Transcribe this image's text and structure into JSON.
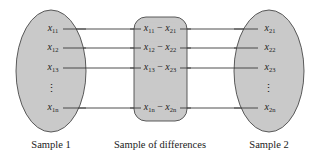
{
  "diagram": {
    "colors": {
      "fill": "#c9c9c9",
      "stroke": "#4a4a4a",
      "line": "#3a3a3a",
      "text": "#222222"
    },
    "sample1": {
      "label": "Sample 1",
      "items": [
        {
          "base": "x",
          "sub": "11"
        },
        {
          "base": "x",
          "sub": "12"
        },
        {
          "base": "x",
          "sub": "13"
        },
        {
          "base": "x",
          "sub": "1n"
        }
      ],
      "ellipsis": "⋮"
    },
    "differences": {
      "label": "Sample of differences",
      "items": [
        {
          "a": "x",
          "a_sub": "11",
          "op": " − ",
          "b": "x",
          "b_sub": "21"
        },
        {
          "a": "x",
          "a_sub": "12",
          "op": " − ",
          "b": "x",
          "b_sub": "22"
        },
        {
          "a": "x",
          "a_sub": "13",
          "op": " − ",
          "b": "x",
          "b_sub": "23"
        },
        {
          "a": "x",
          "a_sub": "1n",
          "op": " − ",
          "b": "x",
          "b_sub": "2n"
        }
      ]
    },
    "sample2": {
      "label": "Sample 2",
      "items": [
        {
          "base": "x",
          "sub": "21"
        },
        {
          "base": "x",
          "sub": "22"
        },
        {
          "base": "x",
          "sub": "23"
        },
        {
          "base": "x",
          "sub": "2n"
        }
      ],
      "ellipsis": "⋮"
    }
  }
}
